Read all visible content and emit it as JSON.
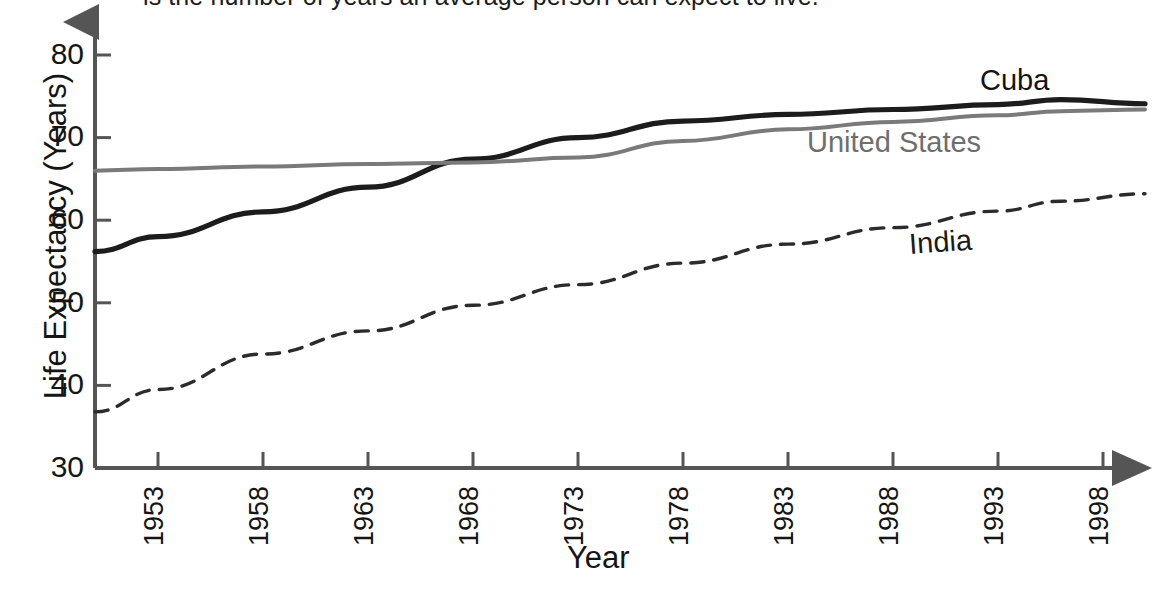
{
  "caption": {
    "text": "is the number of years an average person can expect to live."
  },
  "axes": {
    "y_title": "Life Expectancy (Years)",
    "x_title": "Year",
    "y_ticks": [
      "80",
      "70",
      "60",
      "50",
      "40",
      "30"
    ],
    "x_ticks": [
      "1953",
      "1958",
      "1963",
      "1968",
      "1973",
      "1978",
      "1983",
      "1988",
      "1993",
      "1998"
    ]
  },
  "series_labels": {
    "cuba": "Cuba",
    "united_states": "United States",
    "india": "India"
  },
  "colors": {
    "cuba": "#1c1c1c",
    "united_states": "#7a7a7a",
    "india": "#2b2b2b",
    "axis": "#555555",
    "background": "#ffffff"
  },
  "chart_data": {
    "type": "line",
    "title": "",
    "xlabel": "Year",
    "ylabel": "Life Expectancy (Years)",
    "xlim": [
      1950,
      2000
    ],
    "ylim": [
      30,
      80
    ],
    "yticks": [
      30,
      40,
      50,
      60,
      70,
      80
    ],
    "xticks": [
      1953,
      1958,
      1963,
      1968,
      1973,
      1978,
      1983,
      1988,
      1993,
      1998
    ],
    "grid": false,
    "legend": "inline-labels",
    "x": [
      1950,
      1953,
      1958,
      1963,
      1968,
      1973,
      1978,
      1983,
      1988,
      1993,
      1996,
      2000
    ],
    "series": [
      {
        "name": "Cuba",
        "style": "solid-thick",
        "color": "#1c1c1c",
        "values": [
          56.2,
          58.0,
          61.0,
          64.0,
          67.4,
          70.0,
          72.0,
          72.8,
          73.4,
          74.0,
          74.6,
          74.1
        ]
      },
      {
        "name": "United States",
        "style": "solid",
        "color": "#7a7a7a",
        "values": [
          66.0,
          66.2,
          66.5,
          66.8,
          67.0,
          67.6,
          69.6,
          71.0,
          71.9,
          72.7,
          73.2,
          73.4
        ]
      },
      {
        "name": "India",
        "style": "dashed",
        "color": "#2b2b2b",
        "values": [
          36.8,
          39.5,
          43.8,
          46.6,
          49.7,
          52.2,
          54.8,
          57.1,
          59.1,
          61.1,
          62.3,
          63.2
        ]
      }
    ]
  }
}
